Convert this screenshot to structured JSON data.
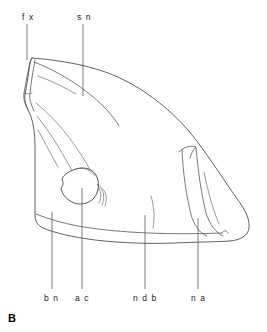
{
  "figure": {
    "panel_letter": "B",
    "caption_labels": [
      {
        "key": "fx",
        "text": "f x",
        "role": "top-label",
        "x": 22,
        "y": 20
      },
      {
        "key": "sn",
        "text": "s n",
        "role": "top-label",
        "x": 77,
        "y": 20
      },
      {
        "key": "bn",
        "text": "b n",
        "role": "bottom-label",
        "x": 44,
        "y": 301
      },
      {
        "key": "ac",
        "text": "a c",
        "role": "bottom-label",
        "x": 75,
        "y": 301
      },
      {
        "key": "ndb",
        "text": "n d b",
        "role": "bottom-label",
        "x": 133,
        "y": 301
      },
      {
        "key": "na",
        "text": "n a",
        "role": "bottom-label",
        "x": 191,
        "y": 301
      }
    ],
    "leaders": [
      {
        "key": "fx",
        "x1": 27,
        "y1": 24,
        "x2": 27,
        "y2": 60
      },
      {
        "key": "sn",
        "x1": 83,
        "y1": 24,
        "x2": 83,
        "y2": 96
      },
      {
        "key": "bn",
        "x1": 52,
        "y1": 212,
        "x2": 52,
        "y2": 289
      },
      {
        "key": "ac",
        "x1": 82,
        "y1": 188,
        "x2": 82,
        "y2": 289
      },
      {
        "key": "ndb",
        "x1": 145,
        "y1": 215,
        "x2": 145,
        "y2": 289
      },
      {
        "key": "na",
        "x1": 198,
        "y1": 218,
        "x2": 198,
        "y2": 289
      }
    ],
    "colors": {
      "ink": "#4f4f4f",
      "ink_light": "#6e6e6e",
      "text": "#1c1c1c",
      "background": "#ffffff"
    },
    "structures": [
      "fx - fracture surface at anterodorsal corner",
      "sn - suture line on dorsal surface",
      "bn - ventral border of fragment",
      "ac - rounded foramen / alveolar canal opening",
      "ndb - nasal diverticulum border",
      "na - narial ridge bundle at posterior end"
    ]
  }
}
